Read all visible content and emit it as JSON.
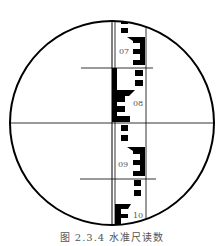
{
  "figure": {
    "caption": "图 2.3.4  水准尺读数",
    "colors": {
      "ink": "#000000",
      "label": "#555555",
      "background": "#ffffff"
    }
  },
  "staff": {
    "labels": [
      "07",
      "08",
      "09",
      "10"
    ]
  },
  "reticle": {
    "crosshair": "horizontal-and-vertical",
    "stadia_lines": [
      "upper",
      "lower"
    ]
  }
}
